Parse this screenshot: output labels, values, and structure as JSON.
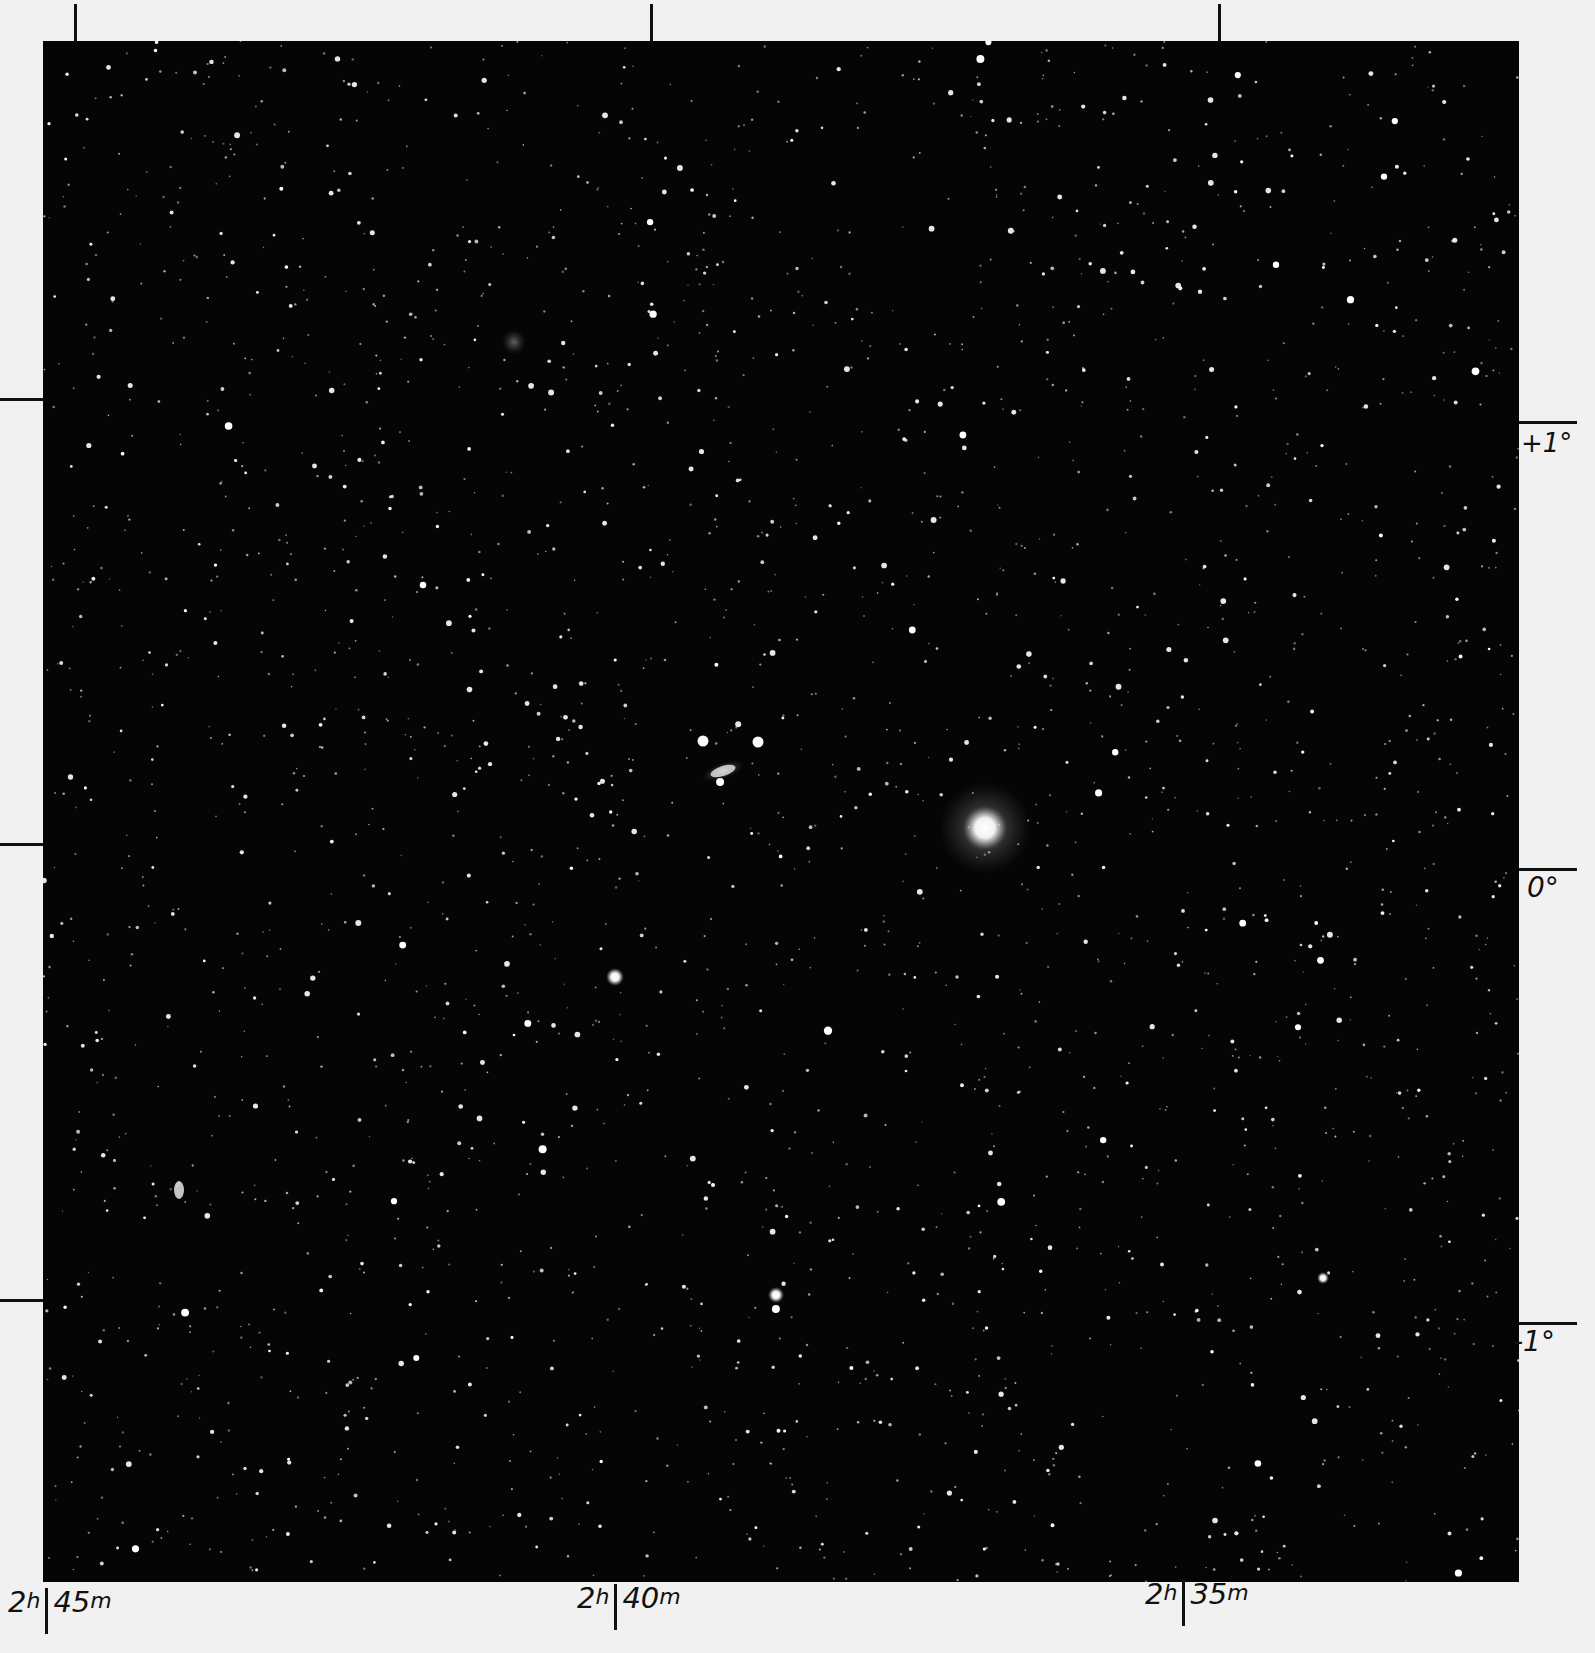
{
  "chart": {
    "type": "star-field-photograph",
    "background_color": "#050505",
    "paper_color": "#f1f1f1",
    "ink_color": "#111111"
  },
  "axes": {
    "right_ascension": {
      "labels": [
        {
          "hours": "2",
          "h_unit": "h",
          "minutes": "45",
          "m_unit": "m",
          "x": 52
        },
        {
          "hours": "2",
          "h_unit": "h",
          "minutes": "40",
          "m_unit": "m",
          "x": 620
        },
        {
          "hours": "2",
          "h_unit": "h",
          "minutes": "35",
          "m_unit": "m",
          "x": 1190
        }
      ],
      "top_ticks_x": [
        74,
        650,
        1218
      ]
    },
    "declination": {
      "labels": [
        {
          "text": "+1°",
          "y": 422
        },
        {
          "text": "0°",
          "y": 872
        },
        {
          "text": "-1°",
          "y": 1323
        }
      ],
      "left_ticks_y": [
        398,
        843,
        1299
      ]
    }
  },
  "objects": {
    "bright_star_center": {
      "x": 985,
      "y": 828,
      "r": 22
    },
    "galaxy_center": {
      "x": 723,
      "y": 771
    },
    "galaxy_upper_left": {
      "x": 514,
      "y": 342
    },
    "galaxy_left": {
      "x": 179,
      "y": 1190
    },
    "star_left_bright": {
      "x": 615,
      "y": 977
    },
    "star_lower": {
      "x": 776,
      "y": 1295
    },
    "star_right_lower": {
      "x": 1323,
      "y": 1278
    }
  }
}
